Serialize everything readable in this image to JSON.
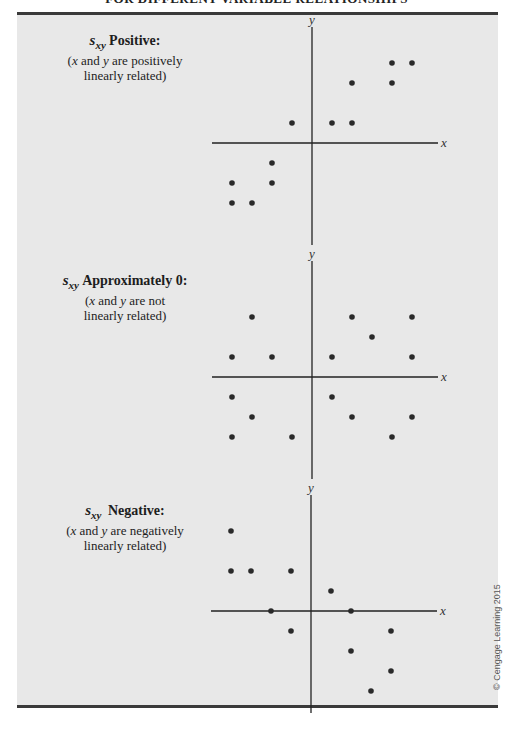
{
  "title": "FOR DIFFERENT VARIABLE RELATIONSHIPS",
  "copyright": "© Cengage Learning 2015",
  "chart_data": [
    {
      "type": "scatter",
      "label_symbol": "s",
      "label_subscript": "xy",
      "label_head": "Positive:",
      "label_line1_pre": "(",
      "label_x": "x",
      "label_and": " and ",
      "label_y": "y",
      "label_line1_post": " are positively",
      "label_line2": "linearly related)",
      "xlabel": "x",
      "ylabel": "y",
      "xlim": [
        -5,
        6
      ],
      "ylim": [
        -5,
        5
      ],
      "points": [
        [
          4,
          4
        ],
        [
          5,
          4
        ],
        [
          2,
          3
        ],
        [
          4,
          3
        ],
        [
          -1,
          1
        ],
        [
          1,
          1
        ],
        [
          2,
          1
        ],
        [
          -2,
          -1
        ],
        [
          -4,
          -2
        ],
        [
          -2,
          -2
        ],
        [
          -4,
          -3
        ],
        [
          -3,
          -3
        ]
      ]
    },
    {
      "type": "scatter",
      "label_symbol": "s",
      "label_subscript": "xy",
      "label_head": "Approximately 0:",
      "label_line1_pre": "(",
      "label_x": "x",
      "label_and": " and ",
      "label_y": "y",
      "label_line1_post": " are not",
      "label_line2": "linearly related)",
      "xlabel": "x",
      "ylabel": "y",
      "xlim": [
        -5,
        6
      ],
      "ylim": [
        -5,
        5
      ],
      "points": [
        [
          -3,
          3
        ],
        [
          2,
          3
        ],
        [
          5,
          3
        ],
        [
          3,
          2
        ],
        [
          -4,
          1
        ],
        [
          -2,
          1
        ],
        [
          1,
          1
        ],
        [
          5,
          1
        ],
        [
          -4,
          -1
        ],
        [
          1,
          -1
        ],
        [
          -3,
          -2
        ],
        [
          2,
          -2
        ],
        [
          5,
          -2
        ],
        [
          -4,
          -3
        ],
        [
          -1,
          -3
        ],
        [
          4,
          -3
        ]
      ]
    },
    {
      "type": "scatter",
      "label_symbol": "s",
      "label_subscript": "xy",
      "label_head": "Negative:",
      "label_line1_pre": "(",
      "label_x": "x",
      "label_and": " and ",
      "label_y": "y",
      "label_line1_post": " are negatively",
      "label_line2": "linearly related)",
      "xlabel": "x",
      "ylabel": "y",
      "xlim": [
        -5,
        6
      ],
      "ylim": [
        -5,
        5
      ],
      "points": [
        [
          -4,
          4
        ],
        [
          -4,
          2
        ],
        [
          -3,
          2
        ],
        [
          -1,
          2
        ],
        [
          1,
          1
        ],
        [
          -2,
          0
        ],
        [
          2,
          0
        ],
        [
          -1,
          -1
        ],
        [
          4,
          -1
        ],
        [
          2,
          -2
        ],
        [
          4,
          -3
        ],
        [
          3,
          -4
        ]
      ]
    }
  ]
}
